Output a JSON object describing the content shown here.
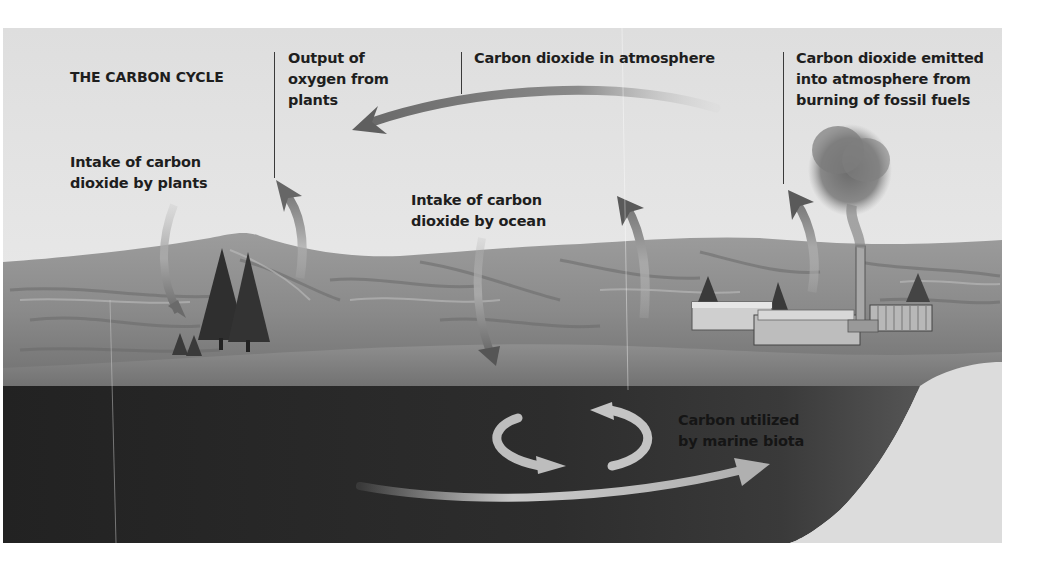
{
  "diagram": {
    "title": "THE CARBON CYCLE",
    "labels": {
      "output_oxygen": "Output of\noxygen from\nplants",
      "co2_atmosphere": "Carbon dioxide in atmosphere",
      "co2_emitted": "Carbon dioxide emitted\ninto atmosphere from\nburning of fossil fuels",
      "intake_plants": "Intake of carbon\ndioxide by plants",
      "intake_ocean": "Intake of carbon\ndioxide by ocean",
      "marine_biota": "Carbon utilized\nby marine biota"
    },
    "arrows": [
      {
        "name": "atmosphere-to-plants-arrow",
        "direction": "right-to-left"
      },
      {
        "name": "plants-intake-arrow",
        "direction": "down"
      },
      {
        "name": "plants-oxygen-output-arrow",
        "direction": "up"
      },
      {
        "name": "ocean-intake-arrow",
        "direction": "down"
      },
      {
        "name": "ocean-release-arrow",
        "direction": "up"
      },
      {
        "name": "fossil-fuel-emission-arrow",
        "direction": "up"
      },
      {
        "name": "marine-cycle-arrows",
        "direction": "circular"
      },
      {
        "name": "deep-ocean-current-arrow",
        "direction": "left-to-right"
      }
    ],
    "colors": {
      "sky": "#e9e9e9",
      "land": "#8a8a8a",
      "shore": "#7a7a7a",
      "ocean": "#2b2b2b",
      "arrow": "#9a9a9a",
      "text": "#1e1e1e"
    }
  }
}
